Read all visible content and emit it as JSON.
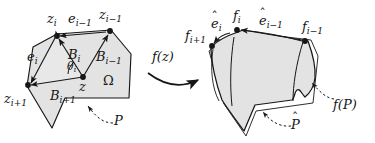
{
  "figure": {
    "caption_domain": "Conformal mapping of a polygon",
    "colors": {
      "ink": "#161616",
      "fill": "#e3e3e3",
      "fill_alt": "#ececec",
      "background": "#ffffff"
    }
  },
  "source_side": {
    "region_label": "Ω",
    "polygon_label": "P",
    "angle_label": {
      "base": "θ",
      "sub": "i"
    },
    "center_point": "z",
    "vertices": [
      {
        "name": "z_i",
        "base": "z",
        "sub": "i"
      },
      {
        "name": "z_i-1",
        "base": "z",
        "sub": "i−1"
      },
      {
        "name": "z_i+1",
        "base": "z",
        "sub": "i+1"
      }
    ],
    "edges": [
      {
        "name": "e_i",
        "base": "e",
        "sub": "i"
      },
      {
        "name": "e_i-1",
        "base": "e",
        "sub": "i−1"
      }
    ],
    "bisectors": [
      {
        "name": "B_i",
        "base": "B",
        "sub": "i"
      },
      {
        "name": "B_i-1",
        "base": "B",
        "sub": "i−1"
      },
      {
        "name": "B_i+1",
        "base": "B",
        "sub": "i+1"
      }
    ]
  },
  "map_arrow": {
    "label_f": "f",
    "label_arg": "(z)"
  },
  "target_side": {
    "polygon_label_base": "f",
    "polygon_label_arg": "(P)",
    "hat_polygon_label": "P",
    "hat_mark": "ˆ",
    "vertices": [
      {
        "name": "f_i",
        "base": "f",
        "sub": "i"
      },
      {
        "name": "f_i-1",
        "base": "f",
        "sub": "i−1"
      },
      {
        "name": "f_i+1",
        "base": "f",
        "sub": "i+1"
      }
    ],
    "edges": [
      {
        "name": "e_hat_i",
        "base": "e",
        "sub": "i",
        "hat": "ˆ"
      },
      {
        "name": "e_hat_i-1",
        "base": "e",
        "sub": "i−1",
        "hat": "ˆ"
      }
    ]
  }
}
